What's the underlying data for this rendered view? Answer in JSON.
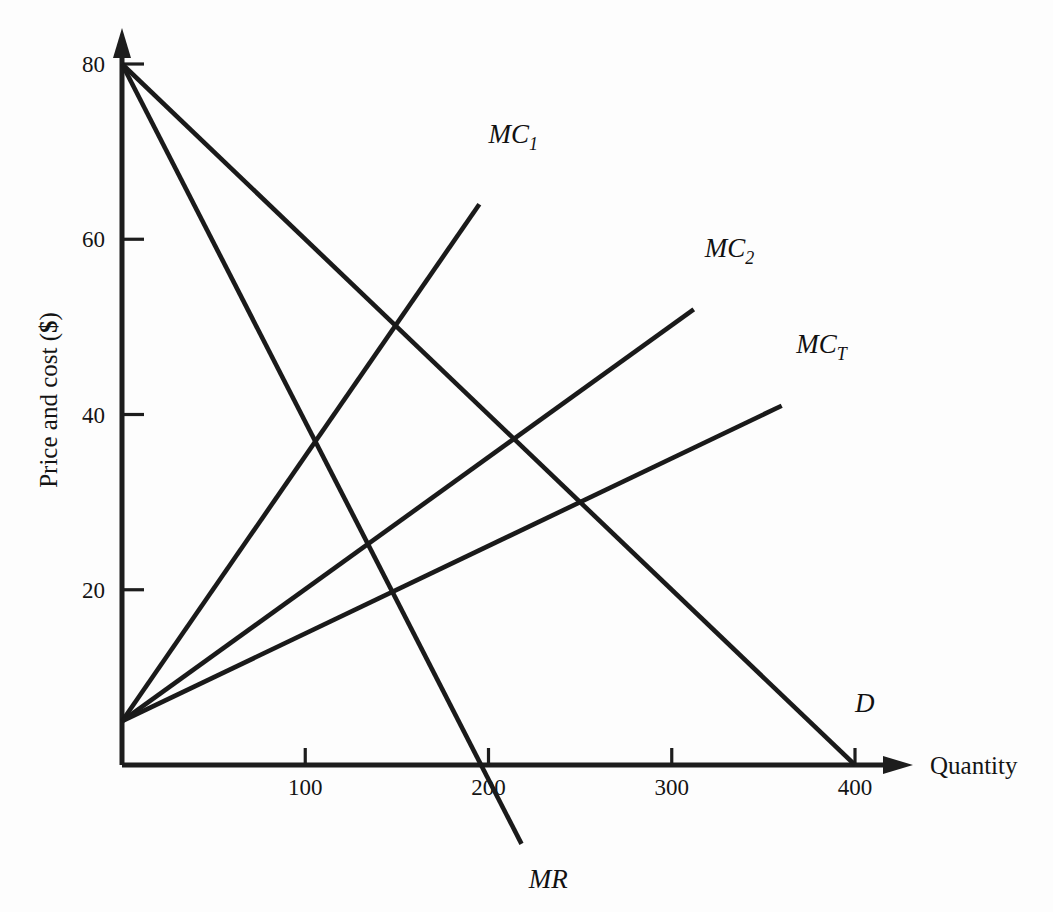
{
  "chart_data": {
    "type": "line",
    "title": "",
    "xlabel": "Quantity",
    "ylabel": "Price and cost ($)",
    "xlim": [
      0,
      450
    ],
    "ylim": [
      0,
      84
    ],
    "grid": false,
    "legend": "inline-curve-labels",
    "x_ticks": [
      100,
      200,
      300,
      400
    ],
    "x_tick_labels": [
      "100",
      "200",
      "300",
      "400"
    ],
    "y_ticks": [
      20,
      40,
      60,
      80
    ],
    "y_tick_labels": [
      "20",
      "40",
      "60",
      "80"
    ],
    "series": [
      {
        "name": "D",
        "label": "D",
        "label_base": "D",
        "label_sub": "",
        "role": "demand",
        "points": [
          [
            0,
            80
          ],
          [
            400,
            0
          ]
        ],
        "label_x": 400,
        "label_y": 6
      },
      {
        "name": "MR",
        "label": "MR",
        "label_base": "MR",
        "label_sub": "",
        "role": "marginal-revenue",
        "points": [
          [
            0,
            80
          ],
          [
            218,
            -9
          ]
        ],
        "label_x": 222,
        "label_y": -14
      },
      {
        "name": "MC1",
        "label": "MC1",
        "label_base": "MC",
        "label_sub": "1",
        "role": "marginal-cost-firm-1",
        "points": [
          [
            0,
            5
          ],
          [
            195,
            64
          ]
        ],
        "label_x": 200,
        "label_y": 71
      },
      {
        "name": "MC2",
        "label": "MC2",
        "label_base": "MC",
        "label_sub": "2",
        "role": "marginal-cost-firm-2",
        "points": [
          [
            0,
            5
          ],
          [
            312,
            52
          ]
        ],
        "label_x": 318,
        "label_y": 58
      },
      {
        "name": "MCT",
        "label": "MCT",
        "label_base": "MC",
        "label_sub": "T",
        "role": "marginal-cost-total",
        "points": [
          [
            0,
            5
          ],
          [
            360,
            41
          ]
        ],
        "label_x": 368,
        "label_y": 47
      }
    ],
    "colors": {
      "background": "#fdfdfd",
      "axis": "#1d1d1d",
      "curve": "#1a1a1a",
      "text": "#141414"
    }
  }
}
